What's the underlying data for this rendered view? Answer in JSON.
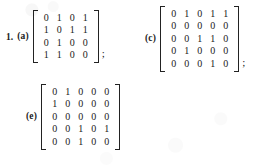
{
  "document": {
    "background_color": "#ffffff",
    "text_color": "#1a1a1a",
    "exercise_number": "1.",
    "separator": ";"
  },
  "exercises": [
    {
      "id": "a",
      "label": "(a)",
      "item_number": "1.",
      "rows": 4,
      "cols": 4,
      "matrix": [
        [
          0,
          1,
          0,
          1
        ],
        [
          1,
          0,
          1,
          1
        ],
        [
          0,
          1,
          0,
          0
        ],
        [
          1,
          1,
          0,
          0
        ]
      ],
      "trailing_punctuation": ";"
    },
    {
      "id": "c",
      "label": "(c)",
      "item_number": "",
      "rows": 5,
      "cols": 5,
      "matrix": [
        [
          0,
          1,
          0,
          1,
          1
        ],
        [
          0,
          0,
          0,
          0,
          0
        ],
        [
          0,
          0,
          1,
          1,
          0
        ],
        [
          0,
          1,
          0,
          0,
          0
        ],
        [
          0,
          0,
          0,
          1,
          0
        ]
      ],
      "trailing_punctuation": ";"
    },
    {
      "id": "e",
      "label": "(e)",
      "item_number": "",
      "rows": 5,
      "cols": 5,
      "matrix": [
        [
          0,
          1,
          0,
          0,
          0
        ],
        [
          1,
          0,
          0,
          0,
          0
        ],
        [
          0,
          0,
          0,
          0,
          0
        ],
        [
          0,
          0,
          1,
          0,
          1
        ],
        [
          0,
          0,
          1,
          0,
          0
        ]
      ],
      "trailing_punctuation": ""
    }
  ]
}
